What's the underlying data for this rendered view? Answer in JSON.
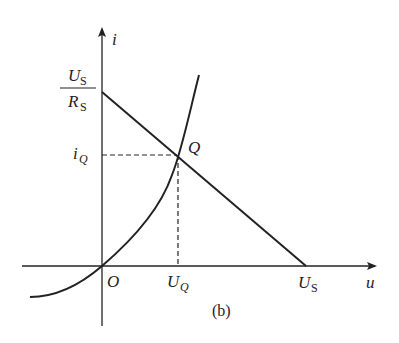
{
  "figure": {
    "caption": "(b)",
    "axes": {
      "x_label": "u",
      "y_label": "i",
      "origin_label": "O"
    },
    "y_intercept_label": {
      "numerator_main": "U",
      "numerator_sub": "S",
      "denominator_main": "R",
      "denominator_sub": "S"
    },
    "x_intercept_label": {
      "main": "U",
      "sub": "S"
    },
    "operating_point": {
      "label": "Q",
      "i_label_main": "i",
      "i_label_sub": "Q",
      "u_label_main": "U",
      "u_label_sub": "Q"
    },
    "curves": [
      {
        "name": "load line",
        "from": "U_S/R_S on i-axis",
        "to": "U_S on u-axis"
      },
      {
        "name": "nonlinear element characteristic",
        "passes_through": [
          "O",
          "Q"
        ]
      }
    ],
    "colors": {
      "stroke": "#222222",
      "background": "#ffffff"
    }
  }
}
